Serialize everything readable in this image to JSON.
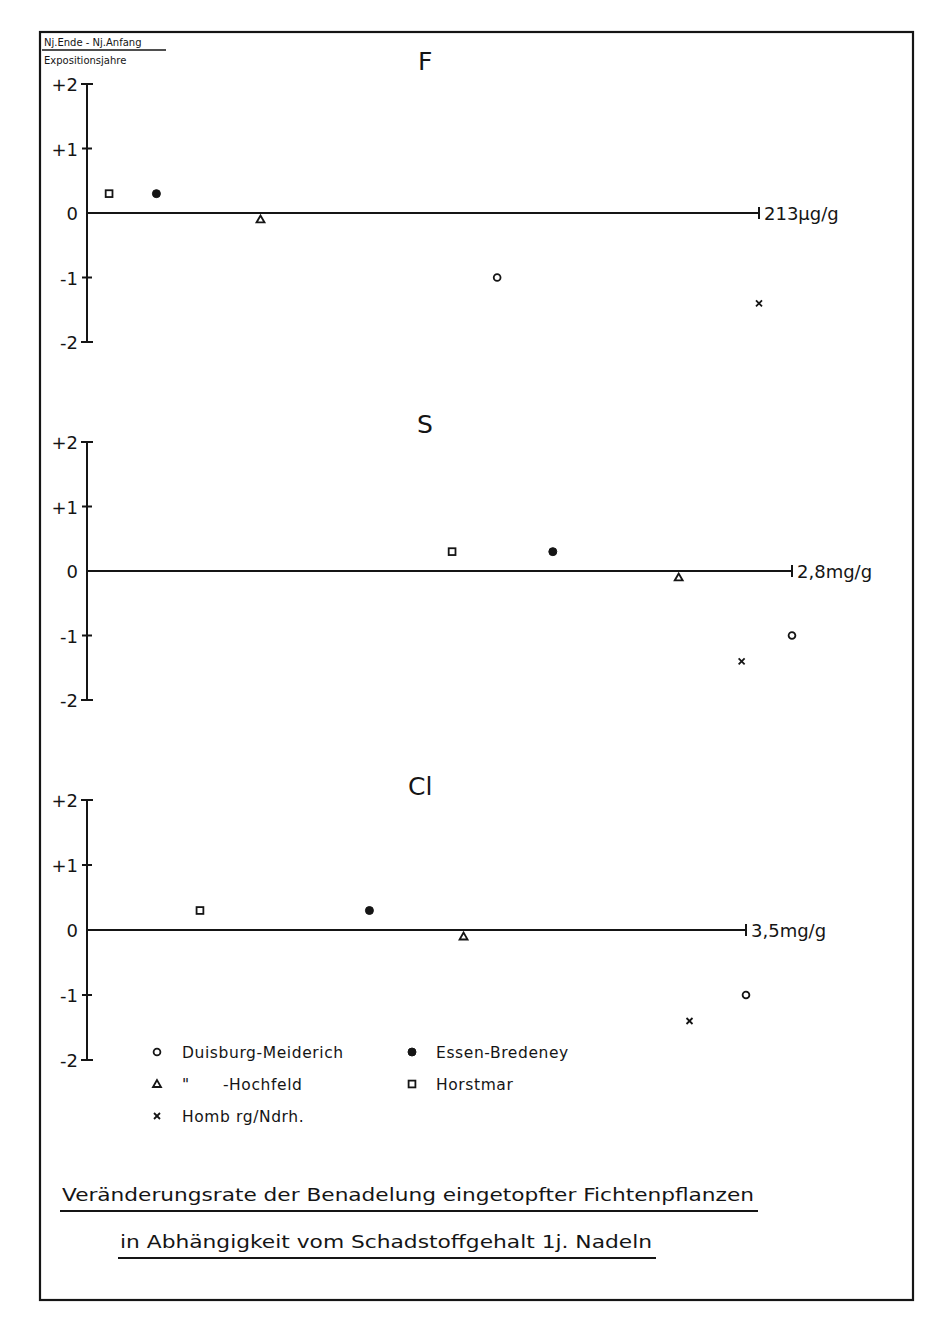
{
  "ylabel": {
    "numerator": "Nj.Ende - Nj.Anfang",
    "denominator": "Expositionsjahre"
  },
  "caption": {
    "line1": "Veränderungsrate der Benadelung eingetopfter Fichtenpflanzen",
    "line2": "in Abhängigkeit vom Schadstoffgehalt 1j. Nadeln"
  },
  "y_ticks": [
    {
      "value": 2,
      "label": "+2"
    },
    {
      "value": 1,
      "label": "+1"
    },
    {
      "value": 0,
      "label": "0"
    },
    {
      "value": -1,
      "label": "-1"
    },
    {
      "value": -2,
      "label": "-2"
    }
  ],
  "legend": [
    {
      "marker": "open-circle",
      "label": "Duisburg-Meiderich"
    },
    {
      "marker": "filled-circle",
      "label": "Essen-Bredeney"
    },
    {
      "marker": "open-triangle",
      "label": "\"      -Hochfeld"
    },
    {
      "marker": "open-square",
      "label": "Horstmar"
    },
    {
      "marker": "cross",
      "label": "Homb rg/Ndrh."
    }
  ],
  "chart_data": [
    {
      "type": "scatter",
      "title": "F",
      "xlabel": "Fluoride content of 1-year needles",
      "ylabel": "Nj.Ende - Nj.Anfang / Expositionsjahre",
      "ylim": [
        -2,
        2
      ],
      "x_reference": {
        "value": 213,
        "unit": "µg/g",
        "label": "213µg/g"
      },
      "grid": false,
      "series": [
        {
          "name": "Horstmar",
          "marker": "open-square",
          "x": 7,
          "y": 0.3
        },
        {
          "name": "Essen-Bredeney",
          "marker": "filled-circle",
          "x": 22,
          "y": 0.3
        },
        {
          "name": "Duisburg-Hochfeld",
          "marker": "open-triangle",
          "x": 55,
          "y": -0.1
        },
        {
          "name": "Duisburg-Meiderich",
          "marker": "open-circle",
          "x": 130,
          "y": -1.0
        },
        {
          "name": "Homberg/Ndrh.",
          "marker": "cross",
          "x": 213,
          "y": -1.4
        }
      ]
    },
    {
      "type": "scatter",
      "title": "S",
      "xlabel": "Sulfur content of 1-year needles",
      "ylabel": "Nj.Ende - Nj.Anfang / Expositionsjahre",
      "ylim": [
        -2,
        2
      ],
      "x_reference": {
        "value": 2.8,
        "unit": "mg/g",
        "label": "2,8mg/g"
      },
      "grid": false,
      "series": [
        {
          "name": "Horstmar",
          "marker": "open-square",
          "x": 1.45,
          "y": 0.3
        },
        {
          "name": "Essen-Bredeney",
          "marker": "filled-circle",
          "x": 1.85,
          "y": 0.3
        },
        {
          "name": "Duisburg-Hochfeld",
          "marker": "open-triangle",
          "x": 2.35,
          "y": -0.1
        },
        {
          "name": "Homberg/Ndrh.",
          "marker": "cross",
          "x": 2.6,
          "y": -1.4
        },
        {
          "name": "Duisburg-Meiderich",
          "marker": "open-circle",
          "x": 2.8,
          "y": -1.0
        }
      ]
    },
    {
      "type": "scatter",
      "title": "Cl",
      "xlabel": "Chloride content of 1-year needles",
      "ylabel": "Nj.Ende - Nj.Anfang / Expositionsjahre",
      "ylim": [
        -2,
        2
      ],
      "x_reference": {
        "value": 3.5,
        "unit": "mg/g",
        "label": "3,5mg/g"
      },
      "grid": false,
      "series": [
        {
          "name": "Horstmar",
          "marker": "open-square",
          "x": 0.6,
          "y": 0.3
        },
        {
          "name": "Essen-Bredeney",
          "marker": "filled-circle",
          "x": 1.5,
          "y": 0.3
        },
        {
          "name": "Duisburg-Hochfeld",
          "marker": "open-triangle",
          "x": 2.0,
          "y": -0.1
        },
        {
          "name": "Homberg/Ndrh.",
          "marker": "cross",
          "x": 3.2,
          "y": -1.4
        },
        {
          "name": "Duisburg-Meiderich",
          "marker": "open-circle",
          "x": 3.5,
          "y": -1.0
        }
      ]
    }
  ]
}
